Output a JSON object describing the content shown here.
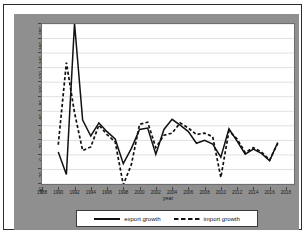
{
  "figure": {
    "background_color": "#8f8f8f",
    "panel_color": "#ffffff",
    "border_color": "#2b2b2b"
  },
  "legend": {
    "export": {
      "label": "export growth",
      "style": "solid",
      "color": "#111111",
      "icon": "solid-line-swatch"
    },
    "import": {
      "label": "import growth",
      "style": "dashed",
      "color": "#111111",
      "icon": "dashed-line-swatch"
    }
  },
  "chart_data": {
    "type": "line",
    "title": "",
    "subtitle": "",
    "xlabel": "year",
    "ylabel": "",
    "grid": true,
    "legend_position": "bottom",
    "xlim": [
      1988,
      2019
    ],
    "ylim": [
      -40,
      180
    ],
    "ytick_step": 20,
    "xtick_step": 2,
    "xticks": [
      1988,
      1990,
      1992,
      1994,
      1996,
      1998,
      2000,
      2002,
      2004,
      2006,
      2008,
      2010,
      2012,
      2014,
      2016,
      2018
    ],
    "yticks": [
      -40,
      -20,
      0,
      20,
      40,
      60,
      80,
      100,
      120,
      140,
      160,
      180
    ],
    "x": [
      1990,
      1991,
      1992,
      1993,
      1994,
      1995,
      1996,
      1997,
      1998,
      1999,
      2000,
      2001,
      2002,
      2003,
      2004,
      2005,
      2006,
      2007,
      2008,
      2009,
      2010,
      2011,
      2012,
      2013,
      2014,
      2015,
      2016,
      2017
    ],
    "series": [
      {
        "name": "export growth",
        "style": "solid",
        "color": "#111111",
        "values": [
          4,
          -27,
          181,
          48,
          26,
          44,
          32,
          22,
          -12,
          9,
          35,
          37,
          1,
          35,
          49,
          41,
          32,
          16,
          20,
          15,
          -3,
          36,
          19,
          1,
          8,
          2,
          -8,
          17
        ]
      },
      {
        "name": "import growth",
        "style": "dashed",
        "color": "#111111",
        "values": [
          14,
          127,
          58,
          6,
          11,
          41,
          28,
          18,
          -41,
          -13,
          42,
          45,
          10,
          27,
          30,
          44,
          37,
          28,
          30,
          25,
          -31,
          33,
          22,
          3,
          10,
          4,
          -7,
          16
        ]
      }
    ]
  }
}
